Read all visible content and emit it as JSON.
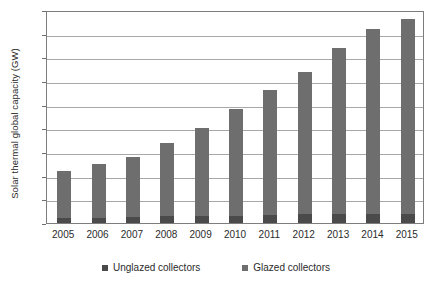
{
  "chart_data": {
    "type": "bar",
    "stacked": true,
    "title": "",
    "xlabel": "",
    "ylabel": "Solar thermal global capacity (GW)",
    "categories": [
      "2005",
      "2006",
      "2007",
      "2008",
      "2009",
      "2010",
      "2011",
      "2012",
      "2013",
      "2014",
      "2015"
    ],
    "series": [
      {
        "name": "Unglazed collectors",
        "color": "#4a4a4a",
        "values": [
          10,
          11,
          12,
          14,
          14,
          15,
          16,
          18,
          19,
          19,
          20
        ]
      },
      {
        "name": "Glazed collectors",
        "color": "#6e6e6e",
        "values": [
          100,
          114,
          128,
          156,
          186,
          225,
          264,
          300,
          351,
          391,
          410
        ]
      }
    ],
    "totals": [
      110,
      125,
      140,
      170,
      200,
      240,
      280,
      318,
      370,
      410,
      430
    ],
    "ylim": [
      0,
      450
    ],
    "yticks": [
      0,
      50,
      100,
      150,
      200,
      250,
      300,
      350,
      400,
      450
    ],
    "ytick_labels": [
      "0",
      "50",
      "100",
      "150",
      "200",
      "250",
      "300",
      "350",
      "400",
      "450"
    ],
    "grid": "horizontal",
    "legend_position": "bottom",
    "plot_background": "#ffffff",
    "grid_color": "#a8a8a8",
    "frame_color": "#7d7d7d"
  },
  "legend": {
    "items": [
      {
        "label": "Unglazed collectors",
        "color": "#4a4a4a"
      },
      {
        "label": "Glazed collectors",
        "color": "#6e6e6e"
      }
    ]
  }
}
